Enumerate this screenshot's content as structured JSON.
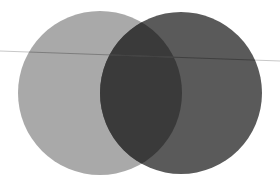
{
  "figure": {
    "title": "Two overlapping translucent circles with a thin horizontal rule",
    "width": 280,
    "height": 185,
    "background_color": "#ffffff"
  },
  "chart_data": {
    "type": "scatter",
    "title": "",
    "xlabel": "",
    "ylabel": "",
    "xlim": [
      0,
      280
    ],
    "ylim": [
      0,
      185
    ],
    "grid": false,
    "legend": null,
    "shapes": [
      {
        "name": "left-circle",
        "kind": "circle",
        "cx": 100,
        "cy": 93,
        "r": 82,
        "fill": "#a9a9a9",
        "opacity": 1,
        "label": "Left circle (light gray)"
      },
      {
        "name": "right-circle",
        "kind": "circle",
        "cx": 181,
        "cy": 93,
        "r": 81,
        "fill": "#5a5a5a",
        "opacity": 1,
        "label": "Right circle (dark gray)"
      }
    ],
    "overlap": {
      "name": "overlap-lens",
      "fill": "#3a3a3a",
      "x_range": [
        100,
        182
      ],
      "label": "Intersection lens (darkest)"
    },
    "line": {
      "name": "horizontal-rule",
      "kind": "line",
      "x1": 0,
      "y1": 51,
      "x2": 280,
      "y2": 61,
      "stroke": "#c8c8c8",
      "stroke_width": 1,
      "label": "Thin rule crossing the figure"
    }
  },
  "elements": {
    "left_circle_label": "left-circle",
    "right_circle_label": "right-circle",
    "overlap_label": "overlap-lens",
    "line_label": "horizontal-rule"
  }
}
